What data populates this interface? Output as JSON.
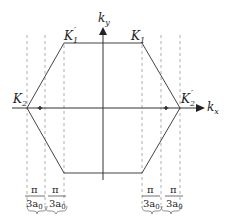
{
  "diagram": {
    "axes": {
      "x_label_main": "k",
      "x_label_sub": "x",
      "y_label_main": "k",
      "y_label_sub": "y"
    },
    "vertices": [
      {
        "id": "K1",
        "main": "K",
        "sub": "1",
        "prime": ""
      },
      {
        "id": "K1p",
        "main": "K",
        "sub": "1",
        "prime": "′"
      },
      {
        "id": "K2",
        "main": "K",
        "sub": "2",
        "prime": ""
      },
      {
        "id": "K2p",
        "main": "K",
        "sub": "2",
        "prime": "′"
      }
    ],
    "intervals": [
      {
        "numerator": "π",
        "denominator": "3a",
        "den_sub": "0"
      },
      {
        "numerator": "π",
        "denominator": "3a",
        "den_sub": "0"
      },
      {
        "numerator": "π",
        "denominator": "3a",
        "den_sub": "0"
      },
      {
        "numerator": "π",
        "denominator": "3a",
        "den_sub": "0"
      }
    ],
    "colors": {
      "line": "#444444",
      "dashed": "#999999",
      "text": "#222222"
    }
  }
}
